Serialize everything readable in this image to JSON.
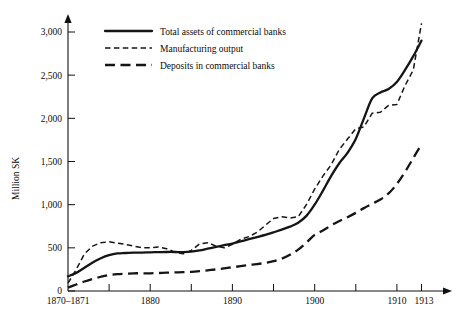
{
  "chart_data": {
    "type": "line",
    "title": "",
    "xlabel": "",
    "ylabel": "Million SK",
    "xlim": [
      1870,
      1913
    ],
    "ylim": [
      0,
      3000
    ],
    "grid": false,
    "legend_position": "top-left inside plot",
    "y_ticks": [
      0,
      500,
      1000,
      1500,
      2000,
      2500,
      3000
    ],
    "y_tick_labels": [
      "0",
      "500",
      "1,000",
      "1,500",
      "2,000",
      "2,500",
      "3,000"
    ],
    "x_tick_values": [
      1870,
      1875,
      1880,
      1885,
      1890,
      1895,
      1900,
      1905,
      1910,
      1913
    ],
    "x_tick_labels": [
      "1870-1871",
      "",
      "1880",
      "",
      "1890",
      "",
      "1900",
      "",
      "1910",
      "1913"
    ],
    "x_labeled_ticks": [
      {
        "value": 1870,
        "label": "1870–1871"
      },
      {
        "value": 1880,
        "label": "1880"
      },
      {
        "value": 1890,
        "label": "1890"
      },
      {
        "value": 1900,
        "label": "1900"
      },
      {
        "value": 1910,
        "label": "1910"
      },
      {
        "value": 1913,
        "label": "1913"
      }
    ],
    "series": [
      {
        "name": "Total assets of commercial banks",
        "style": "solid",
        "x": [
          1870,
          1871,
          1872,
          1873,
          1874,
          1875,
          1876,
          1877,
          1878,
          1879,
          1880,
          1881,
          1882,
          1883,
          1884,
          1885,
          1886,
          1887,
          1888,
          1889,
          1890,
          1891,
          1892,
          1893,
          1894,
          1895,
          1896,
          1897,
          1898,
          1899,
          1900,
          1901,
          1902,
          1903,
          1904,
          1905,
          1906,
          1907,
          1908,
          1909,
          1910,
          1911,
          1912,
          1913
        ],
        "values": [
          170,
          210,
          270,
          330,
          380,
          415,
          435,
          440,
          445,
          445,
          448,
          450,
          452,
          452,
          450,
          455,
          470,
          490,
          510,
          530,
          550,
          575,
          600,
          625,
          650,
          680,
          710,
          745,
          790,
          870,
          1000,
          1160,
          1330,
          1480,
          1600,
          1760,
          2000,
          2230,
          2300,
          2340,
          2420,
          2560,
          2720,
          2900
        ]
      },
      {
        "name": "Manufacturing output",
        "style": "short-dash",
        "x": [
          1870,
          1871,
          1872,
          1873,
          1874,
          1875,
          1876,
          1877,
          1878,
          1879,
          1880,
          1881,
          1882,
          1883,
          1884,
          1885,
          1886,
          1887,
          1888,
          1889,
          1890,
          1891,
          1892,
          1893,
          1894,
          1895,
          1896,
          1897,
          1898,
          1899,
          1900,
          1901,
          1902,
          1903,
          1904,
          1905,
          1906,
          1907,
          1908,
          1909,
          1910,
          1911,
          1912,
          1913
        ],
        "values": [
          90,
          250,
          430,
          520,
          560,
          570,
          555,
          540,
          520,
          500,
          500,
          510,
          490,
          450,
          430,
          470,
          545,
          560,
          520,
          500,
          540,
          600,
          630,
          680,
          760,
          840,
          860,
          845,
          860,
          1000,
          1180,
          1330,
          1460,
          1640,
          1760,
          1880,
          1900,
          2060,
          2070,
          2150,
          2160,
          2380,
          2560,
          3100
        ]
      },
      {
        "name": "Deposits in commercial banks",
        "style": "long-dash",
        "x": [
          1870,
          1871,
          1872,
          1873,
          1874,
          1875,
          1876,
          1877,
          1878,
          1879,
          1880,
          1881,
          1882,
          1883,
          1884,
          1885,
          1886,
          1887,
          1888,
          1889,
          1890,
          1891,
          1892,
          1893,
          1894,
          1895,
          1896,
          1897,
          1898,
          1899,
          1900,
          1901,
          1902,
          1903,
          1904,
          1905,
          1906,
          1907,
          1908,
          1909,
          1910,
          1911,
          1912,
          1913
        ],
        "values": [
          40,
          75,
          110,
          140,
          165,
          185,
          195,
          200,
          205,
          205,
          205,
          208,
          212,
          215,
          218,
          222,
          230,
          240,
          250,
          262,
          275,
          288,
          300,
          312,
          325,
          345,
          375,
          420,
          480,
          560,
          650,
          700,
          760,
          810,
          855,
          905,
          960,
          1010,
          1060,
          1130,
          1240,
          1380,
          1540,
          1700
        ]
      }
    ]
  },
  "axis": {
    "y_title": "Million SK"
  },
  "legend": {
    "items": [
      {
        "label": "Total assets of commercial banks",
        "style": "solid"
      },
      {
        "label": "Manufacturing output",
        "style": "short-dash"
      },
      {
        "label": "Deposits in commercial banks",
        "style": "long-dash"
      }
    ]
  }
}
